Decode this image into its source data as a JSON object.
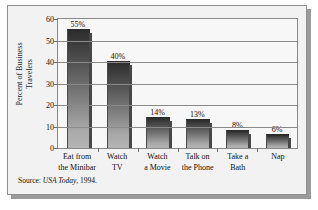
{
  "chart_data": {
    "type": "bar",
    "title": "",
    "subtitle": "",
    "xlabel": "",
    "ylabel": "Percent of Business Travelers",
    "ylabel_lines": [
      "Percent of Business",
      "Travelers"
    ],
    "categories": [
      "Eat from the Minibar",
      "Watch TV",
      "Watch a Movie",
      "Talk on the Phone",
      "Take a Bath",
      "Nap"
    ],
    "category_lines": [
      [
        "Eat from",
        "the Minibar"
      ],
      [
        "Watch",
        "TV"
      ],
      [
        "Watch",
        "a Movie"
      ],
      [
        "Talk on",
        "the Phone"
      ],
      [
        "Take a",
        "Bath"
      ],
      [
        "Nap",
        ""
      ]
    ],
    "values": [
      55,
      40,
      14,
      13,
      8,
      6
    ],
    "data_labels": [
      "55%",
      "40%",
      "14%",
      "13%",
      "8%",
      "6%"
    ],
    "ylim": [
      0,
      60
    ],
    "yticks": [
      0,
      10,
      20,
      30,
      40,
      50,
      60
    ],
    "ytick_labels": [
      "0",
      "10",
      "20",
      "30",
      "40",
      "50",
      "60"
    ],
    "grid": true,
    "grid_axis": "y",
    "legend": false,
    "legend_position": "none",
    "bar_color_top": "#2c2c2c",
    "bar_color_bottom": "#b4b4b4",
    "plot_background": "#f7f7f7",
    "panel_background": "#f2f2f2",
    "frame_color": "#8a8a8a"
  },
  "source": {
    "prefix": "Source: ",
    "publication": "USA Today",
    "suffix": ", 1994."
  }
}
